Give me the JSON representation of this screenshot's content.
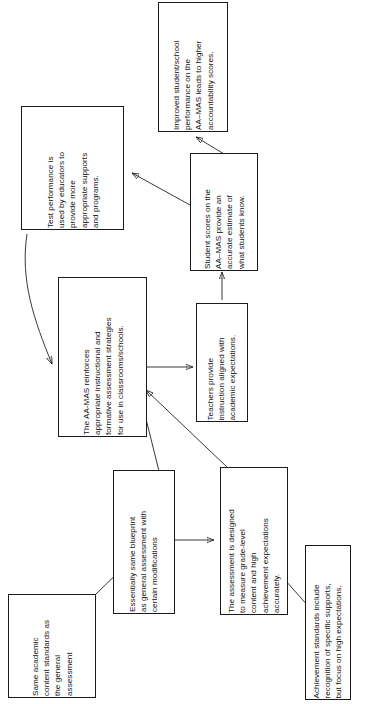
{
  "figure": {
    "orientation": "rotated-90-ccw",
    "background": "#ffffff",
    "line_color": "#222222",
    "text_color": "#111111"
  },
  "nodes": {
    "accountability": {
      "text": "Improved student/school\nperformance on the\nAA–MAS leads to higher\naccountability scores."
    },
    "student_scores": {
      "text": "Student scores on the\nAA–MAS provide an\naccurate estimate of\nwhat students know."
    },
    "test_performance": {
      "text": "Test performance is\nused by educators to\nprovide more\nappropriate supports\nand programs."
    },
    "aa_mas_reinforces": {
      "text": "The AA-MAS reinforces\nappropriate instructional and\nformative assessment strategies\nfor use in classrooms/schools."
    },
    "teachers_provide": {
      "text": "Teachers provide\ninstruction aligned with\nacademic expectations."
    },
    "blueprint": {
      "text": "Essentially same blueprint\nas general assessment with\ncertain modifications"
    },
    "assessment_designed": {
      "text": "The assessment is designed\nto measure grade-level\ncontent and high\nachievement expectations\naccurately."
    },
    "content_standards": {
      "text": "Same academic\ncontent standards as\nthe general\nassessment"
    },
    "achievement_standards": {
      "text": "Achievement standards include\nrecognition of specific supports,\nbut focus on high expectations."
    }
  },
  "edges": [
    {
      "from": "student_scores",
      "to": "accountability",
      "arrow": "single"
    },
    {
      "from": "student_scores",
      "to": "test_performance",
      "arrow": "single"
    },
    {
      "from": "teachers_provide",
      "to": "student_scores",
      "arrow": "single"
    },
    {
      "from": "aa_mas_reinforces",
      "to": "teachers_provide",
      "arrow": "single"
    },
    {
      "from": "test_performance",
      "to": "aa_mas_reinforces",
      "arrow": "single"
    },
    {
      "from": "blueprint",
      "to": "aa_mas_reinforces",
      "arrow": "single"
    },
    {
      "from": "assessment_designed",
      "to": "aa_mas_reinforces",
      "arrow": "single"
    },
    {
      "from": "blueprint",
      "to": "assessment_designed",
      "arrow": "double"
    },
    {
      "from": "content_standards",
      "to": "blueprint",
      "arrow": "single"
    },
    {
      "from": "achievement_standards",
      "to": "assessment_designed",
      "arrow": "single"
    }
  ]
}
